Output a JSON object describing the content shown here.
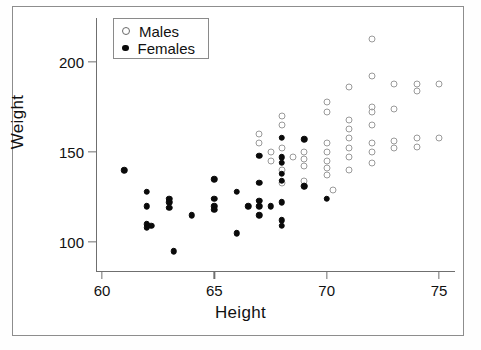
{
  "chart_data": {
    "type": "scatter",
    "title": "",
    "xlabel": "Height",
    "ylabel": "Weight",
    "xlim": [
      59.2,
      75.7
    ],
    "ylim": [
      88,
      219
    ],
    "xticks": [
      60,
      65,
      70,
      75
    ],
    "yticks": [
      100,
      150,
      200
    ],
    "grid": false,
    "legend_position": "top-left",
    "series": [
      {
        "name": "Males",
        "marker": "open-circle",
        "color": "#9a9a9a",
        "points": [
          [
            67.0,
            160
          ],
          [
            67.0,
            155
          ],
          [
            67.5,
            150
          ],
          [
            67.5,
            145
          ],
          [
            68.0,
            170
          ],
          [
            68.0,
            165
          ],
          [
            68.0,
            152
          ],
          [
            68.0,
            140
          ],
          [
            68.0,
            133
          ],
          [
            68.5,
            147
          ],
          [
            69.0,
            150
          ],
          [
            69.0,
            146
          ],
          [
            69.0,
            142
          ],
          [
            69.0,
            134
          ],
          [
            69.0,
            131
          ],
          [
            70.0,
            178
          ],
          [
            70.0,
            172
          ],
          [
            70.0,
            155
          ],
          [
            70.0,
            150
          ],
          [
            70.0,
            145
          ],
          [
            70.0,
            141
          ],
          [
            70.0,
            137
          ],
          [
            70.3,
            129
          ],
          [
            71.0,
            186
          ],
          [
            71.0,
            168
          ],
          [
            71.0,
            163
          ],
          [
            71.0,
            158
          ],
          [
            71.0,
            152
          ],
          [
            71.0,
            147
          ],
          [
            71.0,
            140
          ],
          [
            72.0,
            213
          ],
          [
            72.0,
            192
          ],
          [
            72.0,
            175
          ],
          [
            72.0,
            172
          ],
          [
            72.0,
            165
          ],
          [
            72.0,
            155
          ],
          [
            72.0,
            150
          ],
          [
            72.0,
            144
          ],
          [
            73.0,
            188
          ],
          [
            73.0,
            174
          ],
          [
            73.0,
            156
          ],
          [
            73.0,
            152
          ],
          [
            74.0,
            188
          ],
          [
            74.0,
            184
          ],
          [
            74.0,
            158
          ],
          [
            74.0,
            153
          ],
          [
            75.0,
            188
          ],
          [
            75.0,
            158
          ]
        ]
      },
      {
        "name": "Females",
        "marker": "filled-circle",
        "color": "#0a0a0a",
        "points": [
          [
            61.0,
            140
          ],
          [
            62.0,
            128
          ],
          [
            62.0,
            120
          ],
          [
            62.0,
            110
          ],
          [
            62.0,
            108
          ],
          [
            62.2,
            109
          ],
          [
            63.0,
            124
          ],
          [
            63.0,
            122
          ],
          [
            63.0,
            119
          ],
          [
            63.2,
            95
          ],
          [
            64.0,
            115
          ],
          [
            65.0,
            135
          ],
          [
            65.0,
            124
          ],
          [
            65.0,
            120
          ],
          [
            65.0,
            118
          ],
          [
            66.0,
            128
          ],
          [
            66.0,
            105
          ],
          [
            66.5,
            120
          ],
          [
            67.0,
            148
          ],
          [
            67.0,
            133
          ],
          [
            67.0,
            123
          ],
          [
            67.0,
            120
          ],
          [
            67.0,
            115
          ],
          [
            67.5,
            120
          ],
          [
            68.0,
            158
          ],
          [
            68.0,
            147
          ],
          [
            68.0,
            144
          ],
          [
            68.0,
            138
          ],
          [
            68.0,
            134
          ],
          [
            68.0,
            122
          ],
          [
            68.0,
            112
          ],
          [
            68.0,
            109
          ],
          [
            69.0,
            157
          ],
          [
            69.0,
            131
          ],
          [
            70.0,
            124
          ]
        ]
      }
    ]
  },
  "axis": {
    "x_title": "Height",
    "y_title": "Weight",
    "x_tick_labels": [
      "60",
      "65",
      "70",
      "75"
    ],
    "y_tick_labels": [
      "100",
      "150",
      "200"
    ]
  },
  "legend": {
    "entries": [
      {
        "label": "Males",
        "marker": "open-circle"
      },
      {
        "label": "Females",
        "marker": "filled-circle"
      }
    ]
  }
}
